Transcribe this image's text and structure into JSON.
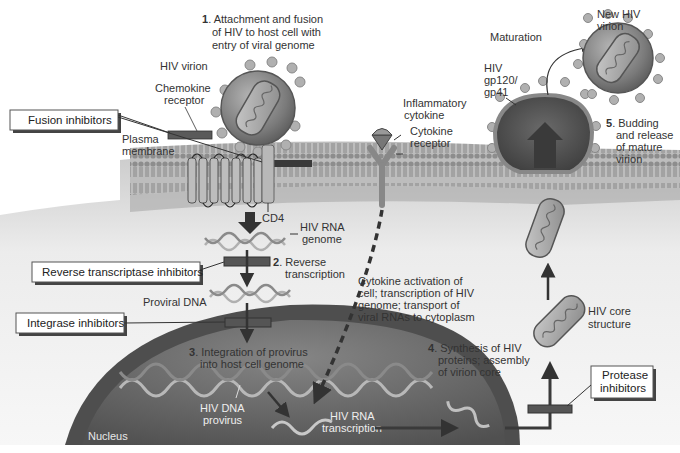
{
  "diagram": {
    "steps": [
      {
        "num": "1",
        "lines": [
          "Attachment and fusion",
          "of HIV to host cell with",
          "entry of viral genome"
        ]
      },
      {
        "num": "2",
        "lines": [
          "Reverse",
          "transcription"
        ]
      },
      {
        "num": "3",
        "lines": [
          "Integration of provirus",
          "into host cell genome"
        ]
      },
      {
        "num": "4",
        "lines": [
          "Synthesis of HIV",
          "proteins; assembly",
          "of virion core"
        ]
      },
      {
        "num": "5",
        "lines": [
          "Budding",
          "and release",
          "of mature",
          "virion"
        ]
      }
    ],
    "drug_boxes": {
      "fusion": "Fusion inhibitors",
      "reverse_transcriptase": "Reverse transcriptase inhibitors",
      "integrase": "Integrase inhibitors",
      "protease": [
        "Protease",
        "inhibitors"
      ]
    },
    "labels": {
      "hiv_virion": "HIV virion",
      "chemokine_receptor": [
        "Chemokine",
        "receptor"
      ],
      "plasma_membrane": [
        "Plasma",
        "membrane"
      ],
      "cd4": "CD4",
      "hiv_rna_genome": [
        "HIV RNA",
        "genome"
      ],
      "proviral_dna": "Proviral DNA",
      "hiv_dna_provirus": [
        "HIV DNA",
        "provirus"
      ],
      "hiv_rna_transcription": [
        "HIV RNA",
        "transcription"
      ],
      "nucleus": "Nucleus",
      "inflammatory_cytokine": [
        "Inflammatory",
        "cytokine"
      ],
      "cytokine_receptor": [
        "Cytokine",
        "receptor"
      ],
      "cytokine_activation": [
        "Cytokine activation of",
        "cell; transcription of HIV",
        "genome; transport of",
        "viral RNAs to cytoplasm"
      ],
      "hiv_core_structure": [
        "HIV core",
        "structure"
      ],
      "maturation": "Maturation",
      "new_hiv_virion": [
        "New HIV",
        "virion"
      ],
      "gp120_gp41": [
        "HIV",
        "gp120/",
        "gp41"
      ]
    },
    "colors": {
      "membrane": "#8a8a8a",
      "cytoplasm_top": "#d0d0d0",
      "cytoplasm_bottom": "#ffffff",
      "nucleus": "#5a5a5a",
      "virion": "#7a7a7a",
      "drug_bar": "#555555",
      "arrow": "#3a3a3a"
    }
  }
}
